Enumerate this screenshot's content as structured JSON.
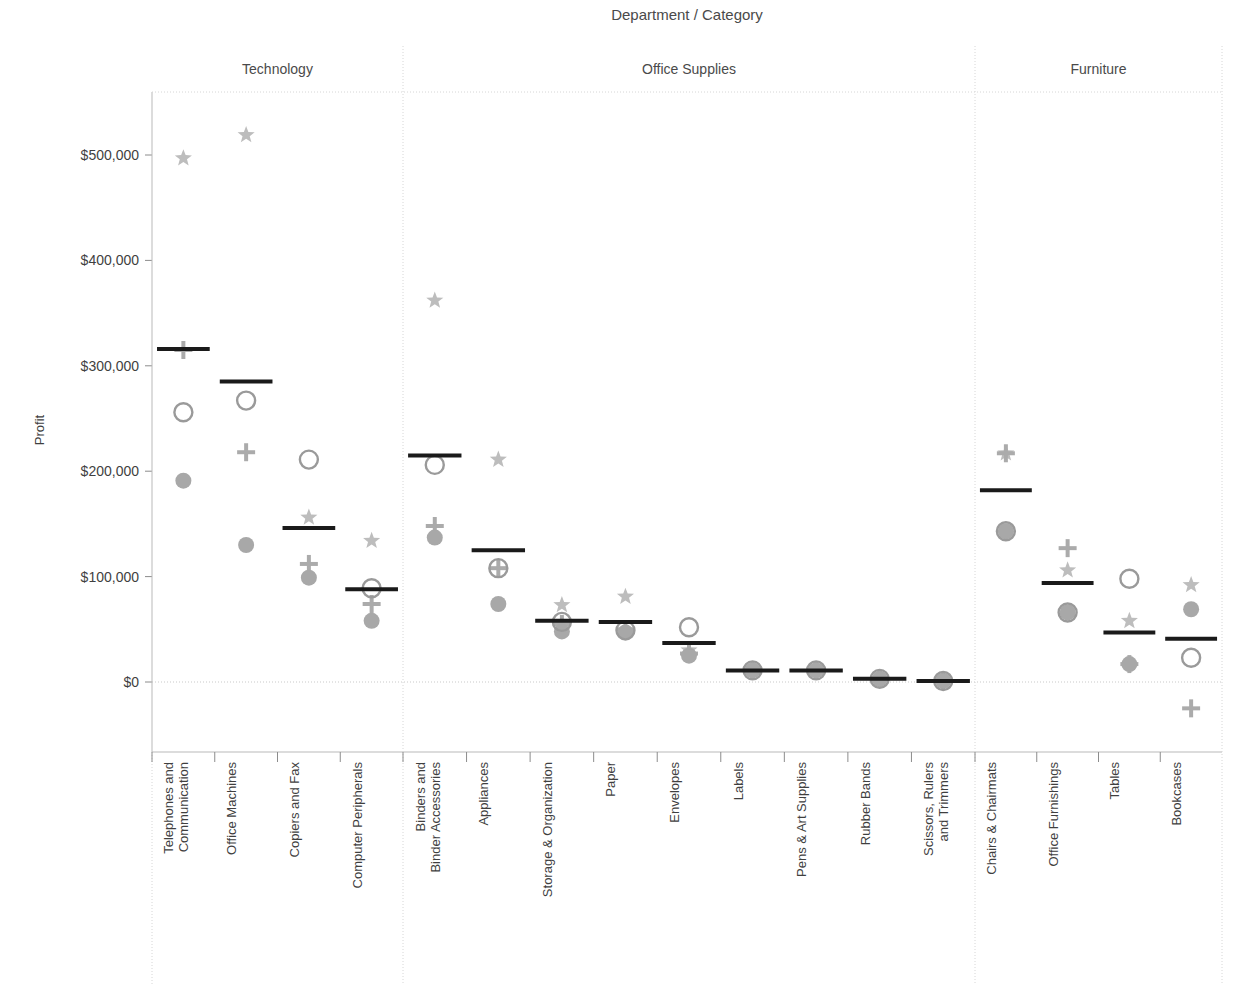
{
  "chart_data": {
    "type": "scatter",
    "title": "Department / Category",
    "xlabel": "",
    "ylabel": "Profit",
    "ylim": [
      -60000,
      560000
    ],
    "ytick_labels": [
      "$500,000",
      "$400,000",
      "$300,000",
      "$200,000",
      "$100,000",
      "$0"
    ],
    "ytick_values": [
      500000,
      400000,
      300000,
      200000,
      100000,
      0
    ],
    "grid": false,
    "legend_position": "none",
    "series": [
      {
        "name": "reference-line",
        "marker": "line"
      },
      {
        "name": "star",
        "marker": "star"
      },
      {
        "name": "plus",
        "marker": "plus"
      },
      {
        "name": "open-circle",
        "marker": "open-circle"
      },
      {
        "name": "filled-circle",
        "marker": "filled-circle"
      }
    ],
    "panels": [
      {
        "name": "Technology",
        "categories": [
          "Telephones and Communication",
          "Office Machines",
          "Copiers and Fax",
          "Computer Peripherals"
        ],
        "reference": [
          316000,
          285000,
          146000,
          88000
        ],
        "star": [
          497000,
          519000,
          156000,
          134000
        ],
        "plus": [
          315000,
          218000,
          112000,
          74000
        ],
        "open_circle": [
          256000,
          267000,
          211000,
          89000
        ],
        "filled_circle": [
          191000,
          130000,
          99000,
          58000
        ]
      },
      {
        "name": "Office Supplies",
        "categories": [
          "Binders and Binder Accessories",
          "Appliances",
          "Storage & Organization",
          "Paper",
          "Envelopes",
          "Labels",
          "Pens & Art Supplies",
          "Rubber Bands",
          "Scissors, Rulers and Trimmers"
        ],
        "reference": [
          215000,
          125000,
          58000,
          57000,
          37000,
          11000,
          11000,
          3000,
          1000
        ],
        "star": [
          362000,
          211000,
          73000,
          81000,
          30000,
          11000,
          11000,
          3000,
          1000
        ],
        "plus": [
          148000,
          108000,
          55000,
          50000,
          27000,
          11000,
          11000,
          3000,
          1000
        ],
        "open_circle": [
          206000,
          108000,
          57000,
          49000,
          52000,
          11000,
          11000,
          3000,
          1000
        ],
        "filled_circle": [
          137000,
          74000,
          48000,
          47000,
          25000,
          11000,
          11000,
          3000,
          1000
        ]
      },
      {
        "name": "Furniture",
        "categories": [
          "Chairs & Chairmats",
          "Office Furnishings",
          "Tables",
          "Bookcases"
        ],
        "reference": [
          182000,
          94000,
          47000,
          41000
        ],
        "star": [
          217000,
          106000,
          58000,
          92000
        ],
        "plus": [
          217000,
          127000,
          17000,
          -25000
        ],
        "open_circle": [
          143000,
          66000,
          98000,
          23000
        ],
        "filled_circle": [
          143000,
          66000,
          17000,
          69000
        ]
      }
    ]
  },
  "colors": {
    "reference_line": "#1a1a1a",
    "star": "#bdbdbd",
    "plus": "#ababab",
    "open_circle": "#9a9a9a",
    "filled_circle": "#a8a8a8",
    "gridline": "#d6d6d6",
    "axis": "#b9b9b9",
    "text": "#3f3f3f"
  }
}
